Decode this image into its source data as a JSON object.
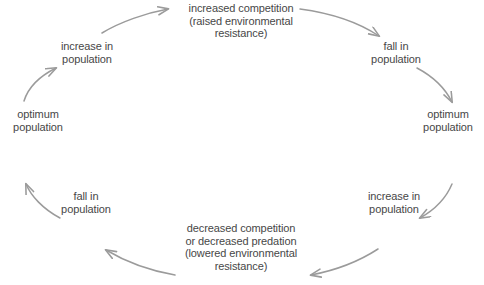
{
  "diagram": {
    "text_color": "#474747",
    "arrow_color": "#9b9b9b",
    "background": "#ffffff",
    "nodes": [
      {
        "id": "optimum-left",
        "label": "optimum\npopulation"
      },
      {
        "id": "increase-upper-left",
        "label": "increase in\npopulation"
      },
      {
        "id": "increased-competition",
        "label": "increased competition\n(raised environmental\nresistance)"
      },
      {
        "id": "fall-upper-right",
        "label": "fall in\npopulation"
      },
      {
        "id": "optimum-right",
        "label": "optimum\npopulation"
      },
      {
        "id": "increase-lower-right",
        "label": "increase in\npopulation"
      },
      {
        "id": "decreased-competition",
        "label": "decreased competition\nor decreased predation\n(lowered environmental\nresistance)"
      },
      {
        "id": "fall-lower-left",
        "label": "fall in\npopulation"
      }
    ],
    "edges": [
      {
        "id": "edge-1",
        "from": "optimum-left",
        "to": "increase-upper-left"
      },
      {
        "id": "edge-2",
        "from": "increase-upper-left",
        "to": "increased-competition"
      },
      {
        "id": "edge-3",
        "from": "increased-competition",
        "to": "fall-upper-right"
      },
      {
        "id": "edge-4",
        "from": "fall-upper-right",
        "to": "optimum-right"
      },
      {
        "id": "edge-5",
        "from": "optimum-right",
        "to": "increase-lower-right"
      },
      {
        "id": "edge-6",
        "from": "increase-lower-right",
        "to": "decreased-competition"
      },
      {
        "id": "edge-7",
        "from": "decreased-competition",
        "to": "fall-lower-left"
      },
      {
        "id": "edge-8",
        "from": "fall-lower-left",
        "to": "optimum-left"
      }
    ]
  }
}
